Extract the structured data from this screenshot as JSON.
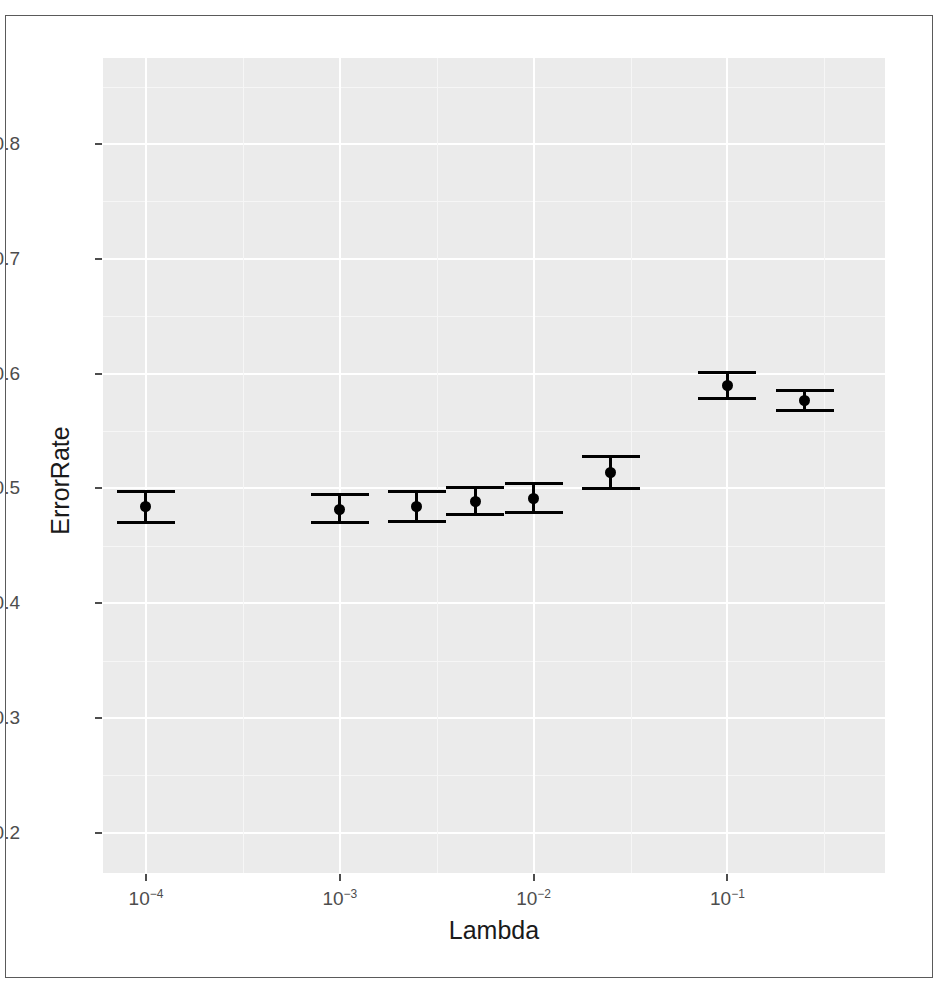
{
  "figure": {
    "has_border": true,
    "panel_background": "#ebebeb",
    "gridline_color": "#ffffff",
    "marker_color": "#000000"
  },
  "axes": {
    "y_title": "ErrorRate",
    "x_title": "Lambda",
    "y_ticks": [
      "0.2",
      "0.3",
      "0.4",
      "0.5",
      "0.6",
      "0.7",
      "0.8"
    ],
    "x_ticks": [
      {
        "base": "10",
        "exp": "−4"
      },
      {
        "base": "10",
        "exp": "−3"
      },
      {
        "base": "10",
        "exp": "−2"
      },
      {
        "base": "10",
        "exp": "−1"
      }
    ]
  },
  "chart_data": {
    "type": "scatter",
    "title": "",
    "xlabel": "Lambda",
    "ylabel": "ErrorRate",
    "xscale": "log",
    "xlim": [
      6e-05,
      0.65
    ],
    "ylim": [
      0.165,
      0.875
    ],
    "grid": true,
    "legend": "none",
    "x_tick_values": [
      0.0001,
      0.001,
      0.01,
      0.1
    ],
    "x_tick_labels": [
      "10^-4",
      "10^-3",
      "10^-2",
      "10^-1"
    ],
    "y_tick_values": [
      0.2,
      0.3,
      0.4,
      0.5,
      0.6,
      0.7,
      0.8
    ],
    "y_tick_labels": [
      "0.2",
      "0.3",
      "0.4",
      "0.5",
      "0.6",
      "0.7",
      "0.8"
    ],
    "series": [
      {
        "name": "ErrorRate",
        "marker": "filled-circle",
        "errorbar": "caps",
        "points": [
          {
            "x": 0.0001,
            "x_label": "1e-04",
            "y": 0.484,
            "ylow": 0.47,
            "yhigh": 0.497
          },
          {
            "x": 0.001,
            "x_label": "1e-03",
            "y": 0.482,
            "ylow": 0.47,
            "yhigh": 0.495
          },
          {
            "x": 0.0025,
            "x_label": "2.5e-03",
            "y": 0.484,
            "ylow": 0.471,
            "yhigh": 0.497
          },
          {
            "x": 0.005,
            "x_label": "5e-03",
            "y": 0.489,
            "ylow": 0.477,
            "yhigh": 0.501
          },
          {
            "x": 0.01,
            "x_label": "1e-02",
            "y": 0.491,
            "ylow": 0.479,
            "yhigh": 0.504
          },
          {
            "x": 0.025,
            "x_label": "2.5e-02",
            "y": 0.514,
            "ylow": 0.5,
            "yhigh": 0.528
          },
          {
            "x": 0.1,
            "x_label": "1e-01",
            "y": 0.59,
            "ylow": 0.578,
            "yhigh": 0.601
          },
          {
            "x": 0.25,
            "x_label": "2.5e-01",
            "y": 0.577,
            "ylow": 0.568,
            "yhigh": 0.585
          }
        ]
      }
    ]
  }
}
